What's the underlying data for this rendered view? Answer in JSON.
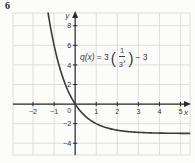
{
  "problem_number": "6",
  "colors": {
    "background": "#fcfcfb",
    "grid": "#d7d7d6",
    "axis": "#2a2a2a",
    "curve": "#3a3a3a",
    "tick_text": "#333333",
    "equation_text": "#3a3a3a"
  },
  "equation": {
    "func": "q(x)",
    "equals_coeff": "= 3",
    "open_paren": "(",
    "numerator": "1",
    "denominator_base": "3",
    "denominator_exp": "x",
    "close_paren": ")",
    "rhs": "− 3"
  },
  "chart_data": {
    "type": "line",
    "title": "",
    "function": {
      "label": "q(x) = 3(1/3^x) − 3",
      "coefficient": 3,
      "base": 3,
      "constant": -3
    },
    "x_axis": {
      "label": "x",
      "min": -2.95,
      "max": 5.45,
      "grid_step": 1,
      "ticks": [
        -2,
        -1,
        0,
        1,
        2,
        3,
        4,
        5
      ]
    },
    "y_axis": {
      "label": "y",
      "min": -5.2,
      "max": 9.3,
      "grid_step": 2,
      "ticks": [
        -4,
        -2,
        2,
        4,
        6,
        8
      ]
    },
    "origin_label": "0",
    "horizontal_asymptote": -3,
    "grid": true,
    "sample_points": [
      {
        "x": -1,
        "y": 6
      },
      {
        "x": 0,
        "y": 0
      },
      {
        "x": 1,
        "y": -2
      },
      {
        "x": 2,
        "y": -2.67
      },
      {
        "x": 5,
        "y": -2.99
      }
    ]
  }
}
